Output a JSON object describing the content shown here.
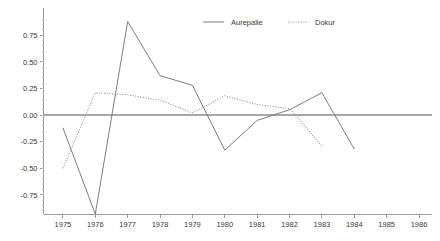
{
  "chart_data": {
    "type": "line",
    "title": "",
    "subtitle": "",
    "xlabel": "",
    "ylabel": "",
    "x": [
      1975,
      1976,
      1977,
      1978,
      1979,
      1980,
      1981,
      1982,
      1983,
      1984
    ],
    "xlim": [
      1974.4,
      1986.4
    ],
    "ylim": [
      -0.93,
      0.95
    ],
    "xticks": [
      "1975",
      "1976",
      "1977",
      "1978",
      "1979",
      "1980",
      "1981",
      "1982",
      "1983",
      "1984",
      "1985",
      "1986"
    ],
    "yticks": [
      "0.75",
      "0.50",
      "0.25",
      "0.00",
      "-0.25",
      "-0.50",
      "-0.75"
    ],
    "ytick_values": [
      0.75,
      0.5,
      0.25,
      0.0,
      -0.25,
      -0.5,
      -0.75
    ],
    "grid": false,
    "legend_position": "top-center",
    "zero_reference_line": 0.0,
    "series": [
      {
        "name": "Aurepalle",
        "style": "solid",
        "color": "#6e6e6e",
        "x": [
          1975,
          1976,
          1977,
          1978,
          1979,
          1980,
          1981,
          1982,
          1983,
          1984
        ],
        "values": [
          -0.12,
          -0.93,
          0.88,
          0.37,
          0.28,
          -0.33,
          -0.05,
          0.05,
          0.21,
          -0.32
        ]
      },
      {
        "name": "Dokur",
        "style": "dotted",
        "color": "#8e8e8e",
        "x": [
          1975,
          1976,
          1977,
          1978,
          1979,
          1980,
          1981,
          1982,
          1983
        ],
        "values": [
          -0.5,
          0.21,
          0.19,
          0.14,
          0.02,
          0.18,
          0.1,
          0.06,
          -0.29
        ]
      }
    ]
  },
  "legend": {
    "items": [
      {
        "label": "Aurepalle"
      },
      {
        "label": "Dokur"
      }
    ]
  },
  "axes": {
    "y_labels": [
      "0.75",
      "0.50",
      "0.25",
      "0.00",
      "-0.25",
      "-0.50",
      "-0.75"
    ],
    "x_labels": [
      "1975",
      "1976",
      "1977",
      "1978",
      "1979",
      "1980",
      "1981",
      "1982",
      "1983",
      "1984",
      "1985",
      "1986"
    ]
  }
}
